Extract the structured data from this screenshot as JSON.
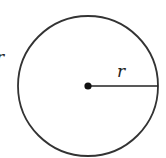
{
  "diagram": {
    "type": "circle-with-radius",
    "labels": {
      "radius": "r",
      "left_partial": "r"
    },
    "colors": {
      "stroke": "#333333",
      "background": "#ffffff"
    }
  }
}
